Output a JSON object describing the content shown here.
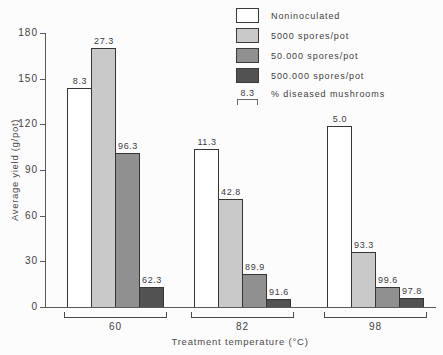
{
  "chart_data": {
    "type": "bar",
    "title": "",
    "xlabel": "Treatment temperature (°C)",
    "ylabel": "Average yield (g/pot)",
    "ylim": [
      0,
      180
    ],
    "yticks": [
      0,
      30,
      60,
      90,
      120,
      150,
      180
    ],
    "grid": false,
    "legend_position": "top-right",
    "categories": [
      "60",
      "82",
      "98"
    ],
    "series": [
      {
        "name": "Noninoculated",
        "color": "#ffffff",
        "values": [
          144,
          104,
          119
        ],
        "diseased_pct": [
          "8.3",
          "11.3",
          "5.0"
        ]
      },
      {
        "name": "5000 spores/pot",
        "color": "#c9c9c9",
        "values": [
          170,
          71,
          36
        ],
        "diseased_pct": [
          "27.3",
          "42.8",
          "93.3"
        ]
      },
      {
        "name": "50.000 spores/pot",
        "color": "#909090",
        "values": [
          101,
          22,
          13
        ],
        "diseased_pct": [
          "96.3",
          "89.9",
          "99.6"
        ]
      },
      {
        "name": "500.000 spores/pot",
        "color": "#525252",
        "values": [
          13,
          5,
          6
        ],
        "diseased_pct": [
          "62.3",
          "91.6",
          "97.8"
        ]
      }
    ],
    "legend_note": {
      "value": "8.3",
      "label": "% diseased mushrooms"
    }
  }
}
